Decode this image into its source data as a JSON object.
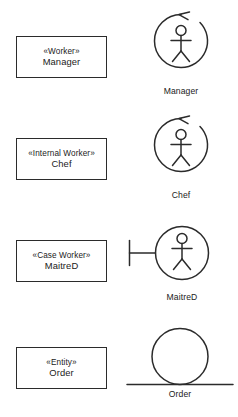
{
  "diagram": {
    "stroke_color": "#2b2b2b",
    "background_color": "#ffffff",
    "rows": [
      {
        "id": "manager",
        "box": {
          "stereotype": "«Worker»",
          "name": "Manager"
        },
        "icon": {
          "type": "actor-in-circle-with-arrow",
          "label": "Manager"
        }
      },
      {
        "id": "chef",
        "box": {
          "stereotype": "«Internal Worker»",
          "name": "Chef"
        },
        "icon": {
          "type": "actor-in-circle-with-arrow",
          "label": "Chef"
        }
      },
      {
        "id": "maitred",
        "box": {
          "stereotype": "«Case Worker»",
          "name": "MaitreD"
        },
        "icon": {
          "type": "actor-in-circle-with-boundary-bar",
          "label": "MaitreD"
        }
      },
      {
        "id": "order",
        "box": {
          "stereotype": "«Entity»",
          "name": "Order"
        },
        "icon": {
          "type": "entity-circle-on-line",
          "label": "Order"
        }
      }
    ]
  }
}
